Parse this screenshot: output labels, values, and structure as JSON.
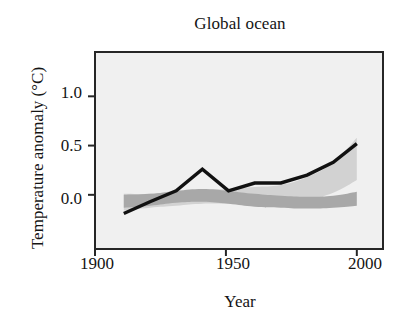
{
  "figure": {
    "title": "Global ocean",
    "xlabel": "Year",
    "ylabel": "Temperature anomaly (°C)",
    "width_px": 412,
    "height_px": 326
  },
  "axes": {
    "x_ticks": [
      "1900",
      "1950",
      "2000"
    ],
    "y_ticks": [
      "1.0",
      "0.5",
      "0.0"
    ],
    "x_tick_values": [
      1900,
      1950,
      2000
    ],
    "y_tick_values": [
      1.0,
      0.5,
      0.0
    ],
    "xlim": [
      1900,
      2010
    ],
    "ylim": [
      -0.55,
      1.45
    ],
    "grid": false,
    "frame": "box",
    "plot_background_color": "#f0f0f0",
    "axis_line_color": "#262626"
  },
  "chart_data": {
    "type": "line",
    "title": "Global ocean",
    "xlabel": "Year",
    "ylabel": "Temperature anomaly (°C)",
    "xlim": [
      1900,
      2010
    ],
    "ylim": [
      -0.55,
      1.45
    ],
    "grid": false,
    "legend": "none",
    "x": [
      1911,
      1921,
      1931,
      1941,
      1951,
      1961,
      1971,
      1981,
      1991,
      2000
    ],
    "series": [
      {
        "name": "Observations",
        "type": "line",
        "color": "#111111",
        "linewidth_px": 3.4,
        "values": [
          -0.19,
          -0.07,
          0.04,
          0.26,
          0.04,
          0.12,
          0.12,
          0.2,
          0.33,
          0.52
        ]
      }
    ],
    "bands": [
      {
        "name": "Models using both natural and anthropogenic forcings",
        "type": "band",
        "color": "#d2d2d2",
        "x": [
          1911,
          1921,
          1931,
          1941,
          1951,
          1961,
          1971,
          1981,
          1991,
          2000
        ],
        "lower": [
          -0.16,
          -0.13,
          -0.11,
          -0.09,
          -0.09,
          -0.09,
          -0.08,
          -0.05,
          0.02,
          0.15
        ],
        "upper": [
          0.01,
          0.01,
          0.03,
          0.05,
          0.06,
          0.08,
          0.1,
          0.18,
          0.33,
          0.58
        ]
      },
      {
        "name": "Models using only natural forcings",
        "type": "band",
        "color": "#a8a8a8",
        "x": [
          1911,
          1921,
          1931,
          1941,
          1951,
          1961,
          1971,
          1981,
          1991,
          2000
        ],
        "lower": [
          -0.13,
          -0.11,
          -0.08,
          -0.07,
          -0.09,
          -0.12,
          -0.13,
          -0.14,
          -0.13,
          -0.11
        ],
        "upper": [
          0.0,
          0.01,
          0.04,
          0.06,
          0.04,
          0.01,
          -0.01,
          -0.02,
          -0.01,
          0.03
        ]
      }
    ]
  }
}
